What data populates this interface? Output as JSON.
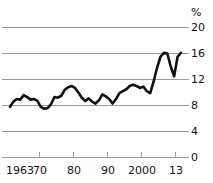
{
  "chart_data": {
    "type": "line",
    "title": "",
    "subtitle": "",
    "xlabel": "",
    "ylabel": "%",
    "unit_label": "%",
    "xlim": [
      1963,
      2013
    ],
    "ylim": [
      0,
      20
    ],
    "grid": true,
    "gridlines_y": [
      4,
      8,
      12,
      16,
      20
    ],
    "legend": "none",
    "axis": {
      "y_ticks": [
        0,
        4,
        8,
        12,
        16,
        20
      ],
      "y_tick_labels": [
        "0",
        "4",
        "8",
        "12",
        "16",
        "20"
      ],
      "x_ticks": [
        1963,
        1970,
        1980,
        1990,
        2000,
        2013
      ],
      "x_tick_labels": [
        "1963",
        "70",
        "80",
        "90",
        "2000",
        "13"
      ]
    },
    "line_color": "#111111",
    "grid_color": "#9a9a9a",
    "series": [
      {
        "name": "value",
        "x": [
          1963,
          1964,
          1965,
          1966,
          1967,
          1968,
          1969,
          1970,
          1971,
          1972,
          1973,
          1974,
          1975,
          1976,
          1977,
          1978,
          1979,
          1980,
          1981,
          1982,
          1983,
          1984,
          1985,
          1986,
          1987,
          1988,
          1989,
          1990,
          1991,
          1992,
          1993,
          1994,
          1995,
          1996,
          1997,
          1998,
          1999,
          2000,
          2001,
          2002,
          2003,
          2004,
          2005,
          2006,
          2007,
          2008,
          2009,
          2010,
          2011,
          2012,
          2013
        ],
        "values": [
          7.8,
          8.6,
          9.0,
          8.9,
          9.6,
          9.3,
          8.9,
          9.0,
          8.7,
          7.8,
          7.5,
          7.6,
          8.2,
          9.3,
          9.2,
          9.5,
          10.4,
          10.8,
          11.0,
          10.7,
          10.0,
          9.2,
          8.7,
          9.1,
          8.6,
          8.3,
          8.8,
          9.7,
          9.4,
          9.0,
          8.3,
          9.0,
          9.9,
          10.2,
          10.5,
          11.0,
          11.2,
          11.0,
          10.7,
          10.9,
          10.2,
          9.9,
          11.7,
          13.8,
          15.5,
          16.1,
          16.0,
          14.0,
          12.5,
          15.5,
          16.1
        ]
      }
    ]
  }
}
